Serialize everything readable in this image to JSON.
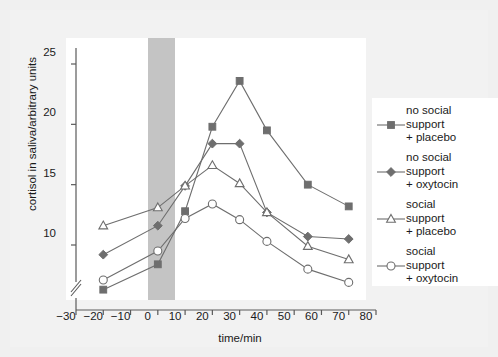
{
  "chart_data": {
    "type": "line",
    "title": "",
    "xlabel": "time/min",
    "ylabel": "cortisol in saliva/arbitrary units",
    "xlim": [
      -30,
      80
    ],
    "ylim": [
      5,
      26.5
    ],
    "xticks": [
      -30,
      -20,
      -10,
      0,
      10,
      20,
      30,
      40,
      50,
      60,
      70,
      80
    ],
    "yticks": [
      10,
      15,
      20,
      25
    ],
    "grid": false,
    "legend_position": "right",
    "y_axis_break": true,
    "annotations": [
      {
        "name": "stress-period-band",
        "type": "vertical-band",
        "x_start": 0,
        "x_end": 10,
        "color": "#c4c4c4"
      }
    ],
    "x": [
      -20,
      0,
      10,
      20,
      30,
      40,
      55,
      70
    ],
    "series": [
      {
        "name": "no social support + placebo",
        "label": "no social\nsupport\n+ placebo",
        "marker": "filled-square",
        "color": "#6e6e6e",
        "values": [
          6.3,
          8.4,
          12.8,
          19.8,
          23.6,
          19.5,
          15.0,
          13.2
        ]
      },
      {
        "name": "no social support + oxytocin",
        "label": "no social\nsupport\n+ oxytocin",
        "marker": "filled-diamond",
        "color": "#6e6e6e",
        "values": [
          9.2,
          11.6,
          14.9,
          18.4,
          18.4,
          12.7,
          10.7,
          10.5
        ]
      },
      {
        "name": "social support + placebo",
        "label": "social\nsupport\n+ placebo",
        "marker": "open-triangle",
        "color": "#6e6e6e",
        "values": [
          11.6,
          13.1,
          14.9,
          16.6,
          15.1,
          12.7,
          9.9,
          8.8
        ]
      },
      {
        "name": "social support + oxytocin",
        "label": "social\nsupport\n+ oxytocin",
        "marker": "open-circle",
        "color": "#6e6e6e",
        "values": [
          7.1,
          9.5,
          12.2,
          13.4,
          12.1,
          10.3,
          8.0,
          6.9
        ]
      }
    ]
  },
  "axis": {
    "xticks_text": [
      "-30",
      "-20",
      "-10",
      "0",
      "10",
      "20",
      "30",
      "40",
      "50",
      "60",
      "70",
      "80"
    ],
    "yticks_text": [
      "10",
      "15",
      "20",
      "25"
    ],
    "xlabel": "time/min",
    "ylabel": "cortisol in saliva/arbitrary units"
  },
  "legend": {
    "entries": [
      {
        "label": "no social\nsupport\n+ placebo",
        "marker": "filled-square"
      },
      {
        "label": "no social\nsupport\n+ oxytocin",
        "marker": "filled-diamond"
      },
      {
        "label": "social\nsupport\n+ placebo",
        "marker": "open-triangle"
      },
      {
        "label": "social\nsupport\n+ oxytocin",
        "marker": "open-circle"
      }
    ]
  },
  "colors": {
    "figure_background": "#f0f0f0",
    "plot_background": "#ffffff",
    "band": "#c4c4c4",
    "line": "#6e6e6e",
    "text": "#1a1a1a",
    "axis": "#5a5a5a"
  }
}
